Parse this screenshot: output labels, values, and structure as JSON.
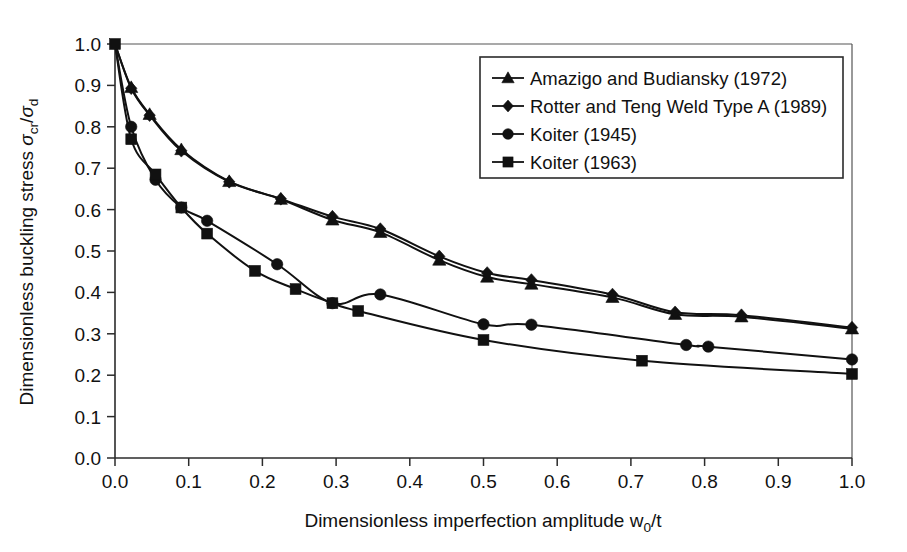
{
  "chart_data": {
    "type": "line",
    "title": "",
    "xlabel": "Dimensionless imperfection amplitude w0/t",
    "ylabel": "Dimensionless buckling stress σcr/σd",
    "xlim": [
      0.0,
      1.0
    ],
    "ylim": [
      0.0,
      1.0
    ],
    "grid": false,
    "legend_position": "upper right",
    "xticks": [
      "0.0",
      "0.1",
      "0.2",
      "0.3",
      "0.4",
      "0.5",
      "0.6",
      "0.7",
      "0.8",
      "0.9",
      "1.0"
    ],
    "xtick_values": [
      0.0,
      0.1,
      0.2,
      0.3,
      0.4,
      0.5,
      0.6,
      0.7,
      0.8,
      0.9,
      1.0
    ],
    "yticks": [
      "0.0",
      "0.1",
      "0.2",
      "0.3",
      "0.4",
      "0.5",
      "0.6",
      "0.7",
      "0.8",
      "0.9",
      "1.0"
    ],
    "ytick_values": [
      0.0,
      0.1,
      0.2,
      0.3,
      0.4,
      0.5,
      0.6,
      0.7,
      0.8,
      0.9,
      1.0
    ],
    "series": [
      {
        "name": "Amazigo and Budiansky (1972)",
        "marker": "triangle",
        "x": [
          0.0,
          0.022,
          0.047,
          0.09,
          0.155,
          0.225,
          0.295,
          0.36,
          0.44,
          0.505,
          0.565,
          0.675,
          0.76,
          0.85,
          1.0
        ],
        "y": [
          1.0,
          0.895,
          0.83,
          0.745,
          0.668,
          0.625,
          0.575,
          0.545,
          0.478,
          0.437,
          0.42,
          0.388,
          0.347,
          0.341,
          0.312
        ]
      },
      {
        "name": "Rotter and Teng Weld Type A (1989)",
        "marker": "diamond",
        "x": [
          0.0,
          0.022,
          0.047,
          0.09,
          0.155,
          0.225,
          0.295,
          0.36,
          0.44,
          0.505,
          0.565,
          0.675,
          0.76,
          0.85,
          1.0
        ],
        "y": [
          1.0,
          0.893,
          0.828,
          0.742,
          0.667,
          0.626,
          0.583,
          0.553,
          0.487,
          0.447,
          0.43,
          0.395,
          0.352,
          0.345,
          0.315
        ]
      },
      {
        "name": "Koiter (1945)",
        "marker": "circle",
        "x": [
          0.0,
          0.022,
          0.055,
          0.09,
          0.125,
          0.22,
          0.295,
          0.36,
          0.5,
          0.565,
          0.775,
          0.805,
          1.0
        ],
        "y": [
          1.0,
          0.8,
          0.672,
          0.605,
          0.573,
          0.468,
          0.374,
          0.395,
          0.323,
          0.322,
          0.273,
          0.269,
          0.238
        ]
      },
      {
        "name": "Koiter (1963)",
        "marker": "square",
        "x": [
          0.0,
          0.022,
          0.055,
          0.09,
          0.125,
          0.19,
          0.245,
          0.295,
          0.33,
          0.5,
          0.715,
          1.0
        ],
        "y": [
          1.0,
          0.77,
          0.685,
          0.605,
          0.542,
          0.452,
          0.408,
          0.374,
          0.355,
          0.285,
          0.235,
          0.203
        ]
      }
    ]
  },
  "axes": {
    "x_label_prefix": "Dimensionless imperfection amplitude w",
    "x_label_sub": "0",
    "x_label_suffix": "/t",
    "y_label_prefix": "Dimensionless buckling stress ",
    "y_label_sigma1": "σ",
    "y_label_sub1": "cr",
    "y_label_slash": "/",
    "y_label_sigma2": "σ",
    "y_label_sub2": "d"
  },
  "legend": {
    "entries": [
      {
        "label": "Amazigo and Budiansky (1972)",
        "marker": "triangle-marker"
      },
      {
        "label": "Rotter and Teng Weld Type A (1989)",
        "marker": "diamond-marker"
      },
      {
        "label": "Koiter (1945)",
        "marker": "circle-marker"
      },
      {
        "label": "Koiter (1963)",
        "marker": "square-marker"
      }
    ]
  },
  "colors": {
    "ink": "#111111",
    "axis": "#2b2b2b",
    "background": "#ffffff"
  }
}
